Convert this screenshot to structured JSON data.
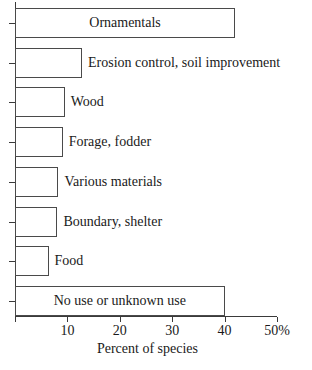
{
  "chart_data": {
    "type": "bar",
    "orientation": "horizontal",
    "title": "",
    "xlabel": "Percent of species",
    "ylabel": "",
    "xlim": [
      0,
      50
    ],
    "grid": false,
    "legend": null,
    "categories": [
      "Ornamentals",
      "Erosion control, soil improvement",
      "Wood",
      "Forage, fodder",
      "Various materials",
      "Boundary, shelter",
      "Food",
      "No use or unknown use"
    ],
    "values": [
      42,
      12.8,
      9.5,
      9.1,
      8.3,
      8.1,
      6.4,
      40
    ],
    "xticks": [
      0,
      10,
      20,
      30,
      40,
      50
    ],
    "xtick_labels": [
      "",
      "10",
      "20",
      "30",
      "40",
      "50%"
    ],
    "bar_fill_color": "#ffffff",
    "bar_edge_color": "#4a4a4a",
    "axis_color": "#3a3a3a",
    "label_placement": [
      "inside",
      "outside",
      "outside",
      "outside",
      "outside",
      "outside",
      "outside",
      "inside"
    ]
  }
}
